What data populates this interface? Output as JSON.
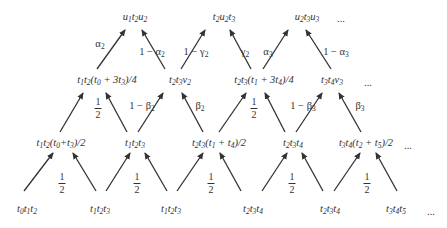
{
  "diagram": {
    "color": "#333333",
    "nodes": [
      {
        "id": "r1a",
        "x": 135,
        "y": 17,
        "parts": [
          [
            "u",
            "1"
          ],
          [
            "t",
            "2"
          ],
          [
            "u",
            "2"
          ]
        ],
        "suffix": ""
      },
      {
        "id": "r1b",
        "x": 224,
        "y": 17,
        "parts": [
          [
            "t",
            "2"
          ],
          [
            "u",
            "2"
          ],
          [
            "t",
            "3"
          ]
        ],
        "suffix": ""
      },
      {
        "id": "r1c",
        "x": 307,
        "y": 17,
        "parts": [
          [
            "u",
            "2"
          ],
          [
            "t",
            "3"
          ],
          [
            "u",
            "3"
          ]
        ],
        "suffix": ""
      },
      {
        "id": "r1d",
        "x": 341,
        "y": 18,
        "text": "..."
      },
      {
        "id": "r2a",
        "x": 107,
        "y": 80,
        "html": "t<sub>1</sub>t<sub>2</sub>(t<sub>0</sub> + 3t<sub>3</sub>)/4"
      },
      {
        "id": "r2b",
        "x": 180,
        "y": 80,
        "parts": [
          [
            "t",
            "2"
          ],
          [
            "t",
            "3"
          ],
          [
            "v",
            "2"
          ]
        ],
        "suffix": ""
      },
      {
        "id": "r2c",
        "x": 264,
        "y": 80,
        "html": "t<sub>2</sub>t<sub>3</sub>(t<sub>1</sub> + 3t<sub>4</sub>)/4"
      },
      {
        "id": "r2d",
        "x": 332,
        "y": 80,
        "parts": [
          [
            "t",
            "3"
          ],
          [
            "t",
            "4"
          ],
          [
            "v",
            "3"
          ]
        ],
        "suffix": ""
      },
      {
        "id": "r2e",
        "x": 368,
        "y": 82,
        "text": "..."
      },
      {
        "id": "r3a",
        "x": 61,
        "y": 143,
        "html": "t<sub>1</sub>t<sub>2</sub>(t<sub>0</sub>+t<sub>3</sub>)/2"
      },
      {
        "id": "r3b",
        "x": 135,
        "y": 143,
        "parts": [
          [
            "t",
            "1"
          ],
          [
            "t",
            "2"
          ],
          [
            "t",
            "3"
          ]
        ],
        "suffix": ""
      },
      {
        "id": "r3c",
        "x": 219,
        "y": 143,
        "html": "t<sub>2</sub>t<sub>3</sub>(t<sub>1</sub> + t<sub>4</sub>)/2"
      },
      {
        "id": "r3d",
        "x": 293,
        "y": 143,
        "parts": [
          [
            "t",
            "2"
          ],
          [
            "t",
            "3"
          ],
          [
            "t",
            "4"
          ]
        ],
        "suffix": ""
      },
      {
        "id": "r3e",
        "x": 366,
        "y": 143,
        "html": "t<sub>3</sub>t<sub>4</sub>(t<sub>2</sub> + t<sub>5</sub>)/2"
      },
      {
        "id": "r3f",
        "x": 408,
        "y": 145,
        "text": "..."
      },
      {
        "id": "r4a",
        "x": 27,
        "y": 209,
        "parts": [
          [
            "t",
            "0"
          ],
          [
            "t",
            "1"
          ],
          [
            "t",
            "2"
          ]
        ],
        "suffix": ""
      },
      {
        "id": "r4b",
        "x": 100,
        "y": 209,
        "parts": [
          [
            "t",
            "1"
          ],
          [
            "t",
            "2"
          ],
          [
            "t",
            "3"
          ]
        ],
        "suffix": ""
      },
      {
        "id": "r4c",
        "x": 171,
        "y": 209,
        "parts": [
          [
            "t",
            "1"
          ],
          [
            "t",
            "2"
          ],
          [
            "t",
            "3"
          ]
        ],
        "suffix": ""
      },
      {
        "id": "r4d",
        "x": 253,
        "y": 209,
        "parts": [
          [
            "t",
            "2"
          ],
          [
            "t",
            "3"
          ],
          [
            "t",
            "4"
          ]
        ],
        "suffix": ""
      },
      {
        "id": "r4e",
        "x": 330,
        "y": 209,
        "parts": [
          [
            "t",
            "2"
          ],
          [
            "t",
            "3"
          ],
          [
            "t",
            "4"
          ]
        ],
        "suffix": ""
      },
      {
        "id": "r4f",
        "x": 396,
        "y": 209,
        "parts": [
          [
            "t",
            "3"
          ],
          [
            "t",
            "4"
          ],
          [
            "t",
            "5"
          ]
        ],
        "suffix": ""
      },
      {
        "id": "r4g",
        "x": 431,
        "y": 211,
        "text": "..."
      }
    ],
    "arrows": [
      {
        "from": [
          97,
          69
        ],
        "to": [
          125,
          30
        ]
      },
      {
        "from": [
          165,
          69
        ],
        "to": [
          142,
          30
        ]
      },
      {
        "from": [
          181,
          69
        ],
        "to": [
          205,
          30
        ]
      },
      {
        "from": [
          251,
          69
        ],
        "to": [
          230,
          30
        ]
      },
      {
        "from": [
          263,
          69
        ],
        "to": [
          288,
          30
        ]
      },
      {
        "from": [
          331,
          69
        ],
        "to": [
          306,
          30
        ]
      },
      {
        "from": [
          60,
          132
        ],
        "to": [
          83,
          93
        ]
      },
      {
        "from": [
          127,
          132
        ],
        "to": [
          106,
          93
        ]
      },
      {
        "from": [
          138,
          132
        ],
        "to": [
          163,
          93
        ]
      },
      {
        "from": [
          203,
          132
        ],
        "to": [
          182,
          93
        ]
      },
      {
        "from": [
          219,
          132
        ],
        "to": [
          246,
          93
        ]
      },
      {
        "from": [
          285,
          132
        ],
        "to": [
          265,
          93
        ]
      },
      {
        "from": [
          296,
          132
        ],
        "to": [
          322,
          93
        ]
      },
      {
        "from": [
          361,
          132
        ],
        "to": [
          339,
          93
        ]
      },
      {
        "from": [
          24,
          191
        ],
        "to": [
          53,
          153
        ]
      },
      {
        "from": [
          96,
          191
        ],
        "to": [
          73,
          153
        ]
      },
      {
        "from": [
          106,
          191
        ],
        "to": [
          130,
          153
        ]
      },
      {
        "from": [
          167,
          191
        ],
        "to": [
          145,
          153
        ]
      },
      {
        "from": [
          177,
          191
        ],
        "to": [
          203,
          153
        ]
      },
      {
        "from": [
          241,
          191
        ],
        "to": [
          220,
          153
        ]
      },
      {
        "from": [
          262,
          191
        ],
        "to": [
          287,
          153
        ]
      },
      {
        "from": [
          323,
          191
        ],
        "to": [
          302,
          153
        ]
      },
      {
        "from": [
          334,
          191
        ],
        "to": [
          360,
          153
        ]
      },
      {
        "from": [
          397,
          191
        ],
        "to": [
          376,
          153
        ]
      }
    ],
    "weights": [
      {
        "id": "w1",
        "x": 100,
        "y": 44,
        "kind": "greek",
        "greek": "α",
        "sub": "2"
      },
      {
        "id": "w2",
        "x": 152,
        "y": 52,
        "kind": "oneminus",
        "greek": "α",
        "sub": "2"
      },
      {
        "id": "w3",
        "x": 196,
        "y": 52,
        "kind": "oneminus",
        "greek": "γ",
        "sub": "2"
      },
      {
        "id": "w4",
        "x": 245,
        "y": 52,
        "kind": "greek",
        "greek": "γ",
        "sub": "2"
      },
      {
        "id": "w5",
        "x": 268,
        "y": 52,
        "kind": "greek",
        "greek": "α",
        "sub": "3"
      },
      {
        "id": "w6",
        "x": 336,
        "y": 52,
        "kind": "oneminus",
        "greek": "α",
        "sub": "3"
      },
      {
        "id": "w7",
        "x": 98,
        "y": 108,
        "kind": "half"
      },
      {
        "id": "w8",
        "x": 142,
        "y": 106,
        "kind": "oneminus",
        "greek": "β",
        "sub": "2"
      },
      {
        "id": "w9",
        "x": 200,
        "y": 106,
        "kind": "greek",
        "greek": "β",
        "sub": "2"
      },
      {
        "id": "w10",
        "x": 254,
        "y": 108,
        "kind": "half"
      },
      {
        "id": "w11",
        "x": 303,
        "y": 106,
        "kind": "oneminus",
        "greek": "β",
        "sub": "3"
      },
      {
        "id": "w12",
        "x": 360,
        "y": 106,
        "kind": "greek",
        "greek": "β",
        "sub": "3"
      },
      {
        "id": "w13",
        "x": 62,
        "y": 183,
        "kind": "half"
      },
      {
        "id": "w14",
        "x": 137,
        "y": 183,
        "kind": "half"
      },
      {
        "id": "w15",
        "x": 211,
        "y": 183,
        "kind": "half"
      },
      {
        "id": "w16",
        "x": 292,
        "y": 183,
        "kind": "half"
      },
      {
        "id": "w17",
        "x": 367,
        "y": 183,
        "kind": "half"
      }
    ],
    "half_num": "1",
    "half_den": "2",
    "one_minus": "1 − "
  }
}
